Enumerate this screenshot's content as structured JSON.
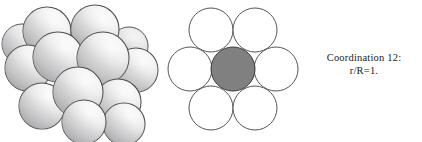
{
  "figure": {
    "background_color": "#ffffff",
    "width": 422,
    "height": 142
  },
  "caption": {
    "line1": "Coordination 12:",
    "line2": "r/R=1.",
    "text_color": "#1a1a1a"
  },
  "cluster_panel": {
    "label": "3D close-packed cluster of 12 spheres around a central sphere",
    "sphere_count": 13,
    "colors": {
      "highlight": "#fdfdfd",
      "body": "#ececed",
      "mid_shade": "#d3d3d4",
      "deep_shade": "#a9a9ab",
      "outline": "#4c4c4c"
    },
    "spheres": [
      {
        "name": "sphere-top-left",
        "cx": 47,
        "cy": 31,
        "r": 24
      },
      {
        "name": "sphere-top-right",
        "cx": 95,
        "cy": 29,
        "r": 24
      },
      {
        "name": "sphere-upper-mid",
        "cx": 58,
        "cy": 57,
        "r": 25
      },
      {
        "name": "sphere-center-upper",
        "cx": 103,
        "cy": 58,
        "r": 26
      },
      {
        "name": "sphere-left-outer",
        "cx": 28,
        "cy": 68,
        "r": 23
      },
      {
        "name": "sphere-right-outer",
        "cx": 136,
        "cy": 70,
        "r": 22
      },
      {
        "name": "sphere-center-front",
        "cx": 78,
        "cy": 92,
        "r": 25
      },
      {
        "name": "sphere-lower-left",
        "cx": 42,
        "cy": 106,
        "r": 23
      },
      {
        "name": "sphere-lower-right",
        "cx": 118,
        "cy": 102,
        "r": 23
      },
      {
        "name": "sphere-bottom-mid",
        "cx": 84,
        "cy": 122,
        "r": 22
      },
      {
        "name": "sphere-bottom-right",
        "cx": 124,
        "cy": 124,
        "r": 21
      },
      {
        "name": "sphere-back-left",
        "cx": 22,
        "cy": 44,
        "r": 20
      },
      {
        "name": "sphere-back-right",
        "cx": 129,
        "cy": 46,
        "r": 19
      }
    ]
  },
  "hex_panel": {
    "label": "2D hexagonal packing: central atom with six touching neighbours",
    "center_circle": {
      "name": "central-atom-circle",
      "cx": 68,
      "cy": 69,
      "r": 22,
      "fill": "#808080",
      "stroke": "#3c3c3c"
    },
    "neighbour_fill": "#ffffff",
    "neighbour_stroke": "#555555",
    "neighbours": [
      {
        "name": "neighbour-circle-top-left",
        "cx": 46,
        "cy": 30,
        "r": 22
      },
      {
        "name": "neighbour-circle-top-right",
        "cx": 90,
        "cy": 30,
        "r": 22
      },
      {
        "name": "neighbour-circle-left",
        "cx": 25,
        "cy": 69,
        "r": 22
      },
      {
        "name": "neighbour-circle-right",
        "cx": 111,
        "cy": 69,
        "r": 22
      },
      {
        "name": "neighbour-circle-bottom-left",
        "cx": 46,
        "cy": 108,
        "r": 22
      },
      {
        "name": "neighbour-circle-bottom-right",
        "cx": 90,
        "cy": 108,
        "r": 22
      }
    ]
  }
}
